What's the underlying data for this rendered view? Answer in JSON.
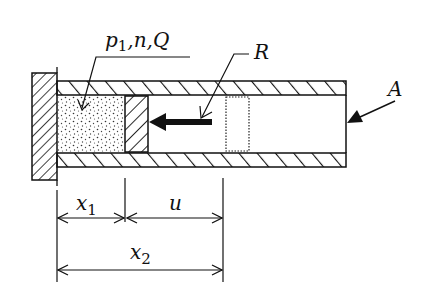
{
  "diagram": {
    "type": "piston-cylinder schematic",
    "labels": {
      "gas_region": "p1,n,Q",
      "gas_p": "p",
      "gas_p_sub": "1",
      "gas_rest": ",n,Q",
      "projectile": "R",
      "tube_end": "A",
      "dim_x1": "x",
      "dim_x1_sub": "1",
      "dim_u": "u",
      "dim_x2": "x",
      "dim_x2_sub": "2"
    },
    "components": [
      {
        "name": "fixed-wall",
        "style": "diagonal hatch"
      },
      {
        "name": "tube-walls",
        "style": "diagonal hatch, top and bottom"
      },
      {
        "name": "gas-chamber",
        "style": "stippled"
      },
      {
        "name": "piston",
        "style": "diagonal hatch"
      },
      {
        "name": "motion-arrow",
        "direction": "left"
      },
      {
        "name": "piston-ghost-position",
        "style": "dotted outline"
      }
    ],
    "dimensions": [
      "x1",
      "u",
      "x2"
    ],
    "colors": {
      "ink": "#111111",
      "background": "#ffffff"
    }
  }
}
